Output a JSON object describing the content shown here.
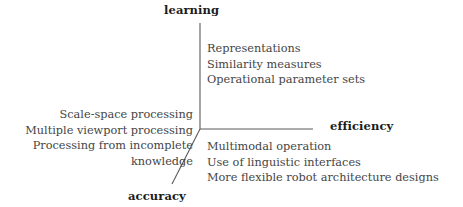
{
  "diagram": {
    "type": "three-axis-concept-diagram",
    "background_color": "#ffffff",
    "line_color": "#5a5a5a",
    "text_color": "#454545",
    "axis_label_color": "#1c1c1c",
    "axes": [
      {
        "id": "learning",
        "label": "learning",
        "direction": "up",
        "items": [
          "Representations",
          "Similarity measures",
          "Operational parameter sets"
        ]
      },
      {
        "id": "efficiency",
        "label": "efficiency",
        "direction": "right",
        "items": [
          "Multimodal operation",
          "Use of linguistic interfaces",
          "More flexible robot architecture designs"
        ]
      },
      {
        "id": "accuracy",
        "label": "accuracy",
        "direction": "down-left-diagonal",
        "items": [
          "Scale-space processing",
          "Multiple viewport processing",
          "Processing from incomplete",
          "knowledge"
        ]
      }
    ]
  }
}
